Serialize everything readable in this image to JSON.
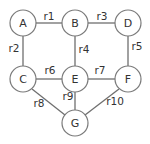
{
  "diagram": {
    "type": "undirected-graph",
    "nodes": [
      {
        "id": "A",
        "label": "A",
        "x": 23,
        "y": 23
      },
      {
        "id": "B",
        "label": "B",
        "x": 75,
        "y": 23
      },
      {
        "id": "D",
        "label": "D",
        "x": 128,
        "y": 23
      },
      {
        "id": "C",
        "label": "C",
        "x": 23,
        "y": 79
      },
      {
        "id": "E",
        "label": "E",
        "x": 75,
        "y": 79
      },
      {
        "id": "F",
        "label": "F",
        "x": 128,
        "y": 79
      },
      {
        "id": "G",
        "label": "G",
        "x": 75,
        "y": 123
      }
    ],
    "edges": [
      {
        "label": "r1",
        "from": "A",
        "to": "B"
      },
      {
        "label": "r2",
        "from": "A",
        "to": "C"
      },
      {
        "label": "r3",
        "from": "B",
        "to": "D"
      },
      {
        "label": "r4",
        "from": "B",
        "to": "E"
      },
      {
        "label": "r5",
        "from": "D",
        "to": "F"
      },
      {
        "label": "r6",
        "from": "C",
        "to": "E"
      },
      {
        "label": "r7",
        "from": "E",
        "to": "F"
      },
      {
        "label": "r8",
        "from": "C",
        "to": "G"
      },
      {
        "label": "r9",
        "from": "E",
        "to": "G"
      },
      {
        "label": "r10",
        "from": "F",
        "to": "G"
      }
    ],
    "colors": {
      "stroke": "#7a7a7a",
      "text": "#333333",
      "background": "#ffffff"
    }
  }
}
